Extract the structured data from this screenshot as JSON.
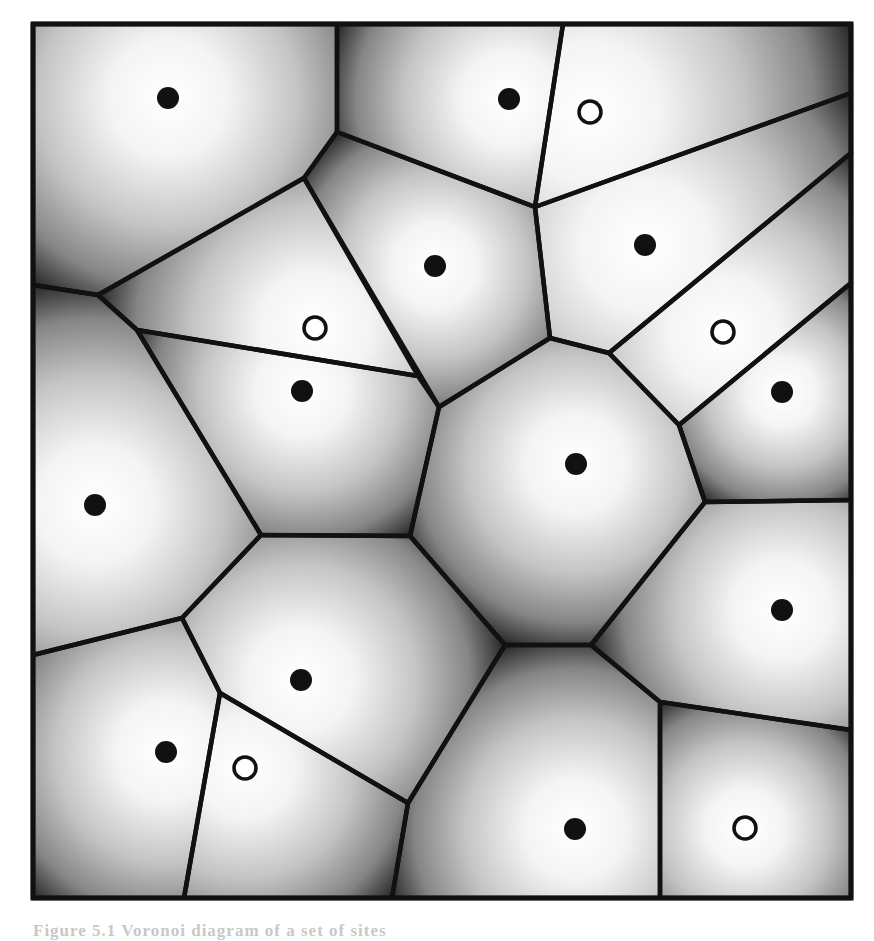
{
  "figure": {
    "type": "voronoi-diagram",
    "frame": {
      "x": 33,
      "y": 24,
      "width": 818,
      "height": 874,
      "stroke": "#111111",
      "stroke_width": 5
    },
    "edge_color": "#111111",
    "edge_width": 4.5,
    "cell_fill_center": "#ffffff",
    "cell_fill_edge": "#1a1a1a",
    "sites": [
      {
        "x": 168,
        "y": 98,
        "kind": "filled"
      },
      {
        "x": 509,
        "y": 99,
        "kind": "filled"
      },
      {
        "x": 590,
        "y": 112,
        "kind": "hollow"
      },
      {
        "x": 435,
        "y": 266,
        "kind": "filled"
      },
      {
        "x": 645,
        "y": 245,
        "kind": "filled"
      },
      {
        "x": 315,
        "y": 328,
        "kind": "hollow"
      },
      {
        "x": 723,
        "y": 332,
        "kind": "hollow"
      },
      {
        "x": 302,
        "y": 391,
        "kind": "filled"
      },
      {
        "x": 782,
        "y": 392,
        "kind": "filled"
      },
      {
        "x": 576,
        "y": 464,
        "kind": "filled"
      },
      {
        "x": 95,
        "y": 505,
        "kind": "filled"
      },
      {
        "x": 782,
        "y": 610,
        "kind": "filled"
      },
      {
        "x": 301,
        "y": 680,
        "kind": "filled"
      },
      {
        "x": 166,
        "y": 752,
        "kind": "filled"
      },
      {
        "x": 245,
        "y": 768,
        "kind": "hollow"
      },
      {
        "x": 575,
        "y": 829,
        "kind": "filled"
      },
      {
        "x": 745,
        "y": 828,
        "kind": "hollow"
      }
    ],
    "cells": [
      {
        "site": 0,
        "points": [
          [
            33,
            24
          ],
          [
            337,
            24
          ],
          [
            337,
            132
          ],
          [
            304,
            178
          ],
          [
            98,
            295
          ],
          [
            33,
            285
          ]
        ]
      },
      {
        "site": 1,
        "points": [
          [
            337,
            24
          ],
          [
            563,
            24
          ],
          [
            535,
            207
          ],
          [
            337,
            132
          ]
        ]
      },
      {
        "site": 2,
        "points": [
          [
            563,
            24
          ],
          [
            851,
            24
          ],
          [
            851,
            93
          ],
          [
            535,
            207
          ]
        ]
      },
      {
        "site": 3,
        "points": [
          [
            304,
            178
          ],
          [
            337,
            132
          ],
          [
            535,
            207
          ],
          [
            550,
            338
          ],
          [
            439,
            407
          ]
        ]
      },
      {
        "site": 4,
        "points": [
          [
            535,
            207
          ],
          [
            851,
            93
          ],
          [
            851,
            153
          ],
          [
            609,
            353
          ],
          [
            550,
            338
          ]
        ]
      },
      {
        "site": 5,
        "points": [
          [
            98,
            295
          ],
          [
            304,
            178
          ],
          [
            418,
            376
          ],
          [
            137,
            330
          ]
        ]
      },
      {
        "site": 6,
        "points": [
          [
            609,
            353
          ],
          [
            851,
            153
          ],
          [
            851,
            283
          ],
          [
            679,
            425
          ]
        ]
      },
      {
        "site": 7,
        "points": [
          [
            137,
            330
          ],
          [
            418,
            376
          ],
          [
            439,
            407
          ],
          [
            410,
            536
          ],
          [
            261,
            535
          ]
        ]
      },
      {
        "site": 8,
        "points": [
          [
            679,
            425
          ],
          [
            851,
            283
          ],
          [
            851,
            500
          ],
          [
            705,
            502
          ]
        ]
      },
      {
        "site": 9,
        "points": [
          [
            439,
            407
          ],
          [
            550,
            338
          ],
          [
            609,
            353
          ],
          [
            679,
            425
          ],
          [
            705,
            502
          ],
          [
            591,
            645
          ],
          [
            505,
            645
          ],
          [
            410,
            536
          ]
        ]
      },
      {
        "site": 10,
        "points": [
          [
            33,
            285
          ],
          [
            98,
            295
          ],
          [
            137,
            330
          ],
          [
            261,
            535
          ],
          [
            182,
            618
          ],
          [
            33,
            655
          ]
        ]
      },
      {
        "site": 11,
        "points": [
          [
            705,
            502
          ],
          [
            851,
            500
          ],
          [
            851,
            730
          ],
          [
            660,
            702
          ],
          [
            591,
            645
          ]
        ]
      },
      {
        "site": 12,
        "points": [
          [
            261,
            535
          ],
          [
            410,
            536
          ],
          [
            505,
            645
          ],
          [
            408,
            803
          ],
          [
            220,
            693
          ],
          [
            182,
            618
          ]
        ]
      },
      {
        "site": 13,
        "points": [
          [
            33,
            655
          ],
          [
            182,
            618
          ],
          [
            220,
            693
          ],
          [
            184,
            898
          ],
          [
            33,
            898
          ]
        ]
      },
      {
        "site": 14,
        "points": [
          [
            220,
            693
          ],
          [
            408,
            803
          ],
          [
            392,
            898
          ],
          [
            184,
            898
          ]
        ]
      },
      {
        "site": 15,
        "points": [
          [
            505,
            645
          ],
          [
            591,
            645
          ],
          [
            660,
            702
          ],
          [
            660,
            898
          ],
          [
            392,
            898
          ],
          [
            408,
            803
          ]
        ]
      },
      {
        "site": 16,
        "points": [
          [
            660,
            702
          ],
          [
            851,
            730
          ],
          [
            851,
            898
          ],
          [
            660,
            898
          ]
        ]
      }
    ]
  },
  "caption": {
    "text": "Figure 5.1  Voronoi diagram of  a  set  of  sites"
  }
}
